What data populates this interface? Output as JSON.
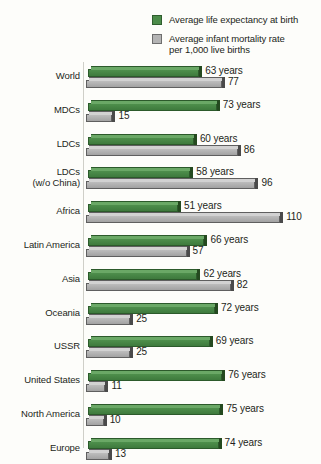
{
  "legend": {
    "items": [
      {
        "icon": "green-square-swatch",
        "color": "#4c8c4a",
        "label": "Average life expectancy at birth",
        "label_line2": ""
      },
      {
        "icon": "gray-square-swatch",
        "color": "#b4b4b4",
        "label": "Average infant mortality rate",
        "label_line2": "per 1,000 live births"
      }
    ]
  },
  "chart_data": {
    "type": "bar",
    "orientation": "horizontal",
    "title": "",
    "subtitle": "",
    "xlabel": "",
    "ylabel": "",
    "grid": false,
    "legend_position": "top-right",
    "xlim": [
      0,
      110
    ],
    "categories": [
      "World",
      "MDCs",
      "LDCs",
      "LDCs\n (w/o China)",
      "Africa",
      "Latin America",
      "Asia",
      "Oceania",
      "USSR",
      "United States",
      "North America",
      "Europe"
    ],
    "series": [
      {
        "name": "Average life expectancy at birth",
        "color": "#4c8c4a",
        "unit": "years",
        "values": [
          63,
          73,
          60,
          58,
          51,
          66,
          62,
          72,
          69,
          76,
          75,
          74
        ],
        "labels": [
          "63 years",
          "73 years",
          "60 years",
          "58 years",
          "51 years",
          "66 years",
          "62 years",
          "72 years",
          "69 years",
          "76 years",
          "75 years",
          "74 years"
        ]
      },
      {
        "name": "Average infant mortality rate per 1,000 live births",
        "color": "#b4b4b4",
        "unit": "per 1,000 live births",
        "values": [
          77,
          15,
          86,
          96,
          110,
          57,
          82,
          25,
          25,
          11,
          10,
          13
        ],
        "labels": [
          "77",
          "15",
          "86",
          "96",
          "110",
          "57",
          "82",
          "25",
          "25",
          "11",
          "10",
          "13"
        ]
      }
    ]
  }
}
